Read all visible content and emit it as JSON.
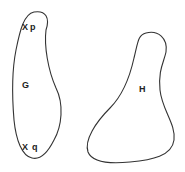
{
  "diagram": {
    "regions": [
      {
        "id": "G",
        "label": "G",
        "points": [
          {
            "marker": "X",
            "label": "p"
          },
          {
            "marker": "X",
            "label": "q"
          }
        ]
      },
      {
        "id": "H",
        "label": "H"
      }
    ],
    "stroke_color": "#333333"
  }
}
